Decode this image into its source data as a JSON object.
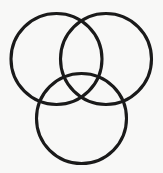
{
  "figure": {
    "name": "three-circle-venn-diagram",
    "width": 163,
    "height": 173,
    "background_color": "#f8f8f7",
    "stroke_color": "#1a1a1a",
    "stroke_width": 3.1,
    "fill": "none"
  },
  "chart_data": {
    "type": "diagram",
    "subtype": "venn",
    "title": "",
    "set_count": 3,
    "all_sets_intersect": true,
    "circles": [
      {
        "name": "top-left-circle",
        "label": "",
        "cx": 56.5,
        "cy": 59,
        "r": 45.5,
        "stroke": "#1a1a1a"
      },
      {
        "name": "top-right-circle",
        "label": "",
        "cx": 106,
        "cy": 59,
        "r": 45.5,
        "stroke": "#1a1a1a"
      },
      {
        "name": "bottom-center-circle",
        "label": "",
        "cx": 81.5,
        "cy": 118.5,
        "r": 45,
        "stroke": "#1a1a1a"
      }
    ],
    "intersection_points": [
      {
        "name": "top-crossing",
        "x": 81,
        "y": 18
      },
      {
        "name": "left-crossing",
        "x": 44,
        "y": 93
      },
      {
        "name": "right-crossing",
        "x": 119,
        "y": 93
      }
    ],
    "bounds": {
      "xmin": 11,
      "xmax": 152,
      "ymin": 13,
      "ymax": 164
    },
    "grid": false,
    "legend": false,
    "axis_labels": []
  }
}
